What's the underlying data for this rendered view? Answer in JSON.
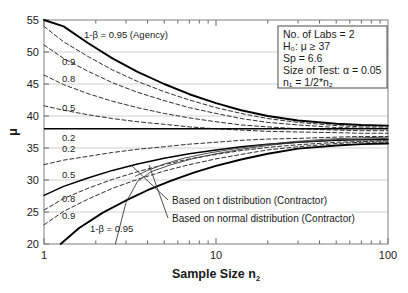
{
  "chart_data": {
    "type": "line",
    "title": "",
    "xlabel": "Sample Size n2",
    "ylabel": "μ",
    "xscale": "log",
    "xlim": [
      1,
      100
    ],
    "ylim": [
      20,
      55
    ],
    "xticks": [
      "1",
      "10",
      "100"
    ],
    "yticks": [
      "20",
      "25",
      "30",
      "35",
      "40",
      "45",
      "50",
      "55"
    ],
    "grid": true,
    "hline": {
      "value": 37,
      "label": "H0 boundary",
      "style": "solid-bold"
    },
    "series": [
      {
        "name": "Agency 1-β = 0.95 (upper)",
        "label": "0.95",
        "style": "solid-bold",
        "x": [
          1,
          1.3,
          1.8,
          2.5,
          3.5,
          5,
          7,
          10,
          14,
          20,
          30,
          50,
          70,
          100
        ],
        "y": [
          56.8,
          54.0,
          51.4,
          49.0,
          46.9,
          45.0,
          43.4,
          42.0,
          40.9,
          40.0,
          39.3,
          38.8,
          38.6,
          38.5
        ]
      },
      {
        "name": "Upper 0.9",
        "label": "0.9",
        "style": "dashed",
        "x": [
          1,
          1.3,
          1.8,
          2.5,
          3.5,
          5,
          7,
          10,
          14,
          20,
          30,
          50,
          70,
          100
        ],
        "y": [
          54.0,
          51.6,
          49.3,
          47.2,
          45.4,
          43.8,
          42.5,
          41.3,
          40.4,
          39.6,
          39.0,
          38.5,
          38.3,
          38.3
        ]
      },
      {
        "name": "Upper 0.8",
        "label": "0.8",
        "style": "dashed",
        "x": [
          1,
          1.3,
          1.8,
          2.5,
          3.5,
          5,
          7,
          10,
          14,
          20,
          30,
          50,
          70,
          100
        ],
        "y": [
          51.1,
          49.0,
          47.0,
          45.2,
          43.7,
          42.4,
          41.3,
          40.4,
          39.6,
          39.0,
          38.6,
          38.2,
          38.1,
          38.1
        ]
      },
      {
        "name": "Upper 0.5",
        "label": "0.5",
        "style": "dashed",
        "x": [
          1,
          1.3,
          1.8,
          2.5,
          3.5,
          5,
          7,
          10,
          14,
          20,
          30,
          50,
          70,
          100
        ],
        "y": [
          46.4,
          44.9,
          43.5,
          42.3,
          41.3,
          40.4,
          39.7,
          39.1,
          38.6,
          38.3,
          38.0,
          37.8,
          37.7,
          37.7
        ]
      },
      {
        "name": "Upper 0.2",
        "label": "0.2",
        "style": "dashed",
        "x": [
          1,
          1.3,
          1.8,
          2.5,
          3.5,
          5,
          7,
          10,
          14,
          20,
          30,
          50,
          70,
          100
        ],
        "y": [
          41.6,
          40.9,
          40.2,
          39.6,
          39.1,
          38.7,
          38.3,
          38.0,
          37.8,
          37.6,
          37.5,
          37.4,
          37.3,
          37.3
        ]
      },
      {
        "name": "Lower 0.2",
        "label": "0.2",
        "style": "dashed",
        "x": [
          1,
          1.3,
          1.8,
          2.5,
          3.5,
          5,
          7,
          10,
          14,
          20,
          30,
          50,
          70,
          100
        ],
        "y": [
          32.4,
          33.1,
          33.7,
          34.3,
          34.8,
          35.2,
          35.6,
          35.9,
          36.2,
          36.4,
          36.5,
          36.7,
          36.8,
          36.8
        ]
      },
      {
        "name": "Lower 0.5",
        "label": "0.5",
        "style": "solid",
        "x": [
          1,
          1.3,
          1.8,
          2.5,
          3.5,
          5,
          7,
          10,
          14,
          20,
          30,
          50,
          70,
          100
        ],
        "y": [
          27.6,
          29.0,
          30.3,
          31.5,
          32.5,
          33.4,
          34.1,
          34.7,
          35.2,
          35.6,
          35.9,
          36.2,
          36.3,
          36.3
        ]
      },
      {
        "name": "Lower 0.8",
        "label": "0.8",
        "style": "dashed",
        "x": [
          1,
          1.3,
          1.8,
          2.5,
          3.5,
          5,
          7,
          10,
          14,
          20,
          30,
          50,
          70,
          100
        ],
        "y": [
          25.3,
          27.1,
          28.7,
          30.1,
          31.3,
          32.4,
          33.3,
          34.0,
          34.6,
          35.1,
          35.5,
          35.9,
          36.0,
          36.1
        ]
      },
      {
        "name": "Lower 0.9",
        "label": "0.9",
        "style": "dashed",
        "x": [
          1,
          1.3,
          1.8,
          2.5,
          3.5,
          5,
          7,
          10,
          14,
          20,
          30,
          50,
          70,
          100
        ],
        "y": [
          23.0,
          25.1,
          27.0,
          28.7,
          30.1,
          31.4,
          32.4,
          33.3,
          34.0,
          34.7,
          35.2,
          35.7,
          35.9,
          35.9
        ]
      },
      {
        "name": "Contractor 1-β = 0.95 (lower)",
        "label": "0.95",
        "style": "solid-bold",
        "x": [
          1.25,
          1.6,
          2.2,
          3,
          4,
          5.5,
          7.5,
          10,
          14,
          20,
          30,
          50,
          70,
          100
        ],
        "y": [
          20.0,
          22.5,
          24.9,
          26.8,
          28.4,
          29.9,
          31.2,
          32.2,
          33.2,
          34.1,
          34.9,
          35.4,
          35.6,
          35.7
        ]
      },
      {
        "name": "Based on t distribution (Contractor)",
        "label": "t-dist",
        "style": "thin",
        "x": [
          2.6,
          3.0,
          3.5,
          4.2,
          5.5,
          7.5,
          10,
          14,
          20,
          30,
          50,
          70,
          100
        ],
        "y": [
          20.0,
          26.5,
          29.8,
          31.3,
          32.4,
          33.4,
          34.1,
          34.8,
          35.4,
          35.9,
          36.3,
          36.4,
          36.5
        ]
      },
      {
        "name": "Based on normal distribution (Contractor)",
        "label": "normal-dist",
        "style": "thin",
        "x": [
          3.4,
          4.0,
          5.0,
          6.5,
          9,
          13,
          19,
          28,
          45,
          70,
          100
        ],
        "y": [
          30.6,
          31.5,
          32.5,
          33.4,
          34.2,
          34.9,
          35.5,
          36.0,
          36.4,
          36.6,
          36.7
        ]
      }
    ],
    "curve_labels_upper": [
      {
        "text": "1-β = 0.95 (Agency)",
        "x": 84,
        "y": 38
      },
      {
        "text": "0.9",
        "x": 62,
        "y": 65
      },
      {
        "text": "0.8",
        "x": 62,
        "y": 82
      },
      {
        "text": "0.5",
        "x": 62,
        "y": 111
      },
      {
        "text": "0.2",
        "x": 62,
        "y": 141
      }
    ],
    "curve_labels_lower": [
      {
        "text": "0.2",
        "x": 62,
        "y": 152
      },
      {
        "text": "0.5",
        "x": 62,
        "y": 178
      },
      {
        "text": "0.8",
        "x": 62,
        "y": 202
      },
      {
        "text": "0.9",
        "x": 62,
        "y": 219
      },
      {
        "text": "1-β = 0.95",
        "x": 90,
        "y": 232
      }
    ],
    "annotations": [
      {
        "text": "Based on t distribution (Contractor)",
        "x": 172,
        "y": 204
      },
      {
        "text": "Based on normal distribution (Contractor)",
        "x": 172,
        "y": 222
      }
    ]
  },
  "legend_box": {
    "lines": [
      {
        "id": "labs",
        "text": "No. of Labs = 2"
      },
      {
        "id": "h0",
        "text": "H₀: μ ≥ 37"
      },
      {
        "id": "sp",
        "text": "Sp  = 6.6"
      },
      {
        "id": "alpha",
        "text": "Size of Test: α = 0.05"
      },
      {
        "id": "n1",
        "text": "n₁ = 1/2*n₂"
      }
    ]
  },
  "axes": {
    "y_label": "μ",
    "x_label_main": "Sample Size n",
    "x_label_sub": "2",
    "y_ticks": [
      "55",
      "50",
      "45",
      "40",
      "35",
      "30",
      "25",
      "20"
    ],
    "x_ticks": [
      "1",
      "10",
      "100"
    ]
  },
  "colors": {
    "line": "#000000",
    "grid": "#d0d0d0",
    "frame": "#808080",
    "text": "#1a1a1a",
    "background": "#ffffff"
  }
}
